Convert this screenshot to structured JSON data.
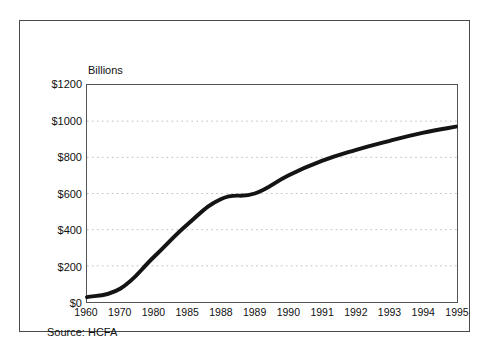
{
  "figure": {
    "top_cutoff_text": "",
    "unit_label": "Billions",
    "source_note": "Source: HCFA"
  },
  "style": {
    "line_color": "#141414",
    "grid_color": "#bdbdbd",
    "axis_color": "#555555",
    "frame_color": "#4a4a4a",
    "text_color": "#111111",
    "background": "#ffffff"
  },
  "chart_data": {
    "type": "line",
    "title": "",
    "subtitle": "",
    "xlabel": "",
    "ylabel": "Billions",
    "categories": [
      "1960",
      "1970",
      "1980",
      "1985",
      "1988",
      "1989",
      "1990",
      "1991",
      "1992",
      "1993",
      "1994",
      "1995"
    ],
    "values": [
      27,
      75,
      250,
      430,
      570,
      600,
      700,
      780,
      840,
      890,
      935,
      970
    ],
    "series": [
      {
        "name": "National health expenditures",
        "values": [
          27,
          75,
          250,
          430,
          570,
          600,
          700,
          780,
          840,
          890,
          935,
          970
        ]
      }
    ],
    "ylim": [
      0,
      1200
    ],
    "y_ticks": [
      0,
      200,
      400,
      600,
      800,
      1000,
      1200
    ],
    "y_tick_labels": [
      "$0",
      "$200",
      "$400",
      "$600",
      "$800",
      "$1000",
      "$1200"
    ],
    "x_tick_labels": [
      "1960",
      "1970",
      "1980",
      "1985",
      "1988",
      "1989",
      "1990",
      "1991",
      "1992",
      "1993",
      "1994",
      "1995"
    ],
    "grid": true,
    "grid_axis": "y",
    "grid_style": "dotted",
    "legend": false,
    "legend_position": "none",
    "annotations": [
      "Billions",
      "Source: HCFA"
    ],
    "line_width_px": 4,
    "units": "Billions of dollars"
  }
}
